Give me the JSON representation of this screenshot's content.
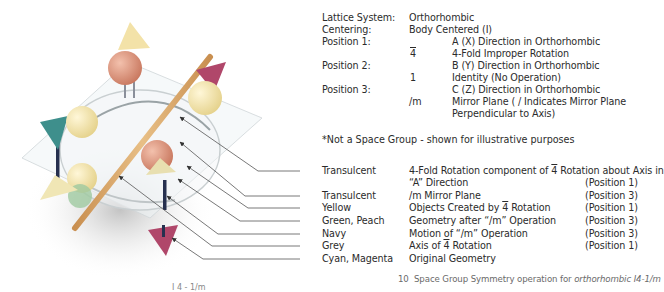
{
  "header": {
    "rows": [
      {
        "label": "Lattice System:",
        "symbol": "",
        "value": "Orthorhombic",
        "indent": false
      },
      {
        "label": "Centering:",
        "symbol": "",
        "value": "Body Centered (I)",
        "indent": false
      },
      {
        "label": "Position 1:",
        "symbol": "",
        "value": "A (X) Direction in Orthorhombic",
        "indent": true
      },
      {
        "label": "",
        "symbol": "4",
        "symbol_overline": true,
        "value": "4-Fold Improper Rotation",
        "indent": true
      },
      {
        "label": "Position 2:",
        "symbol": "",
        "value": "B (Y) Direction in Orthorhombic",
        "indent": true
      },
      {
        "label": "",
        "symbol": "1",
        "value": "Identity (No Operation)",
        "indent": true
      },
      {
        "label": "Position 3:",
        "symbol": "",
        "value": "C (Z) Direction in Orthorhombic",
        "indent": true
      },
      {
        "label": "",
        "symbol": "/m",
        "value": "Mirror Plane ( / Indicates Mirror Plane",
        "indent": true
      },
      {
        "label": "",
        "symbol": "",
        "value": "Perpendicular to Axis)",
        "indent": true
      }
    ],
    "footnote": "*Not a Space Group - shown for illustrative purposes"
  },
  "legend": {
    "rows": [
      {
        "color_name": "Transulcent",
        "description": "4-Fold Rotation component of 4 Rotation about Axis in",
        "description_pre": "4-Fold Rotation component of ",
        "description_bar": "4",
        "description_post": " Rotation about Axis in",
        "position": ""
      },
      {
        "color_name": "",
        "description": "“A” Direction",
        "position": "(Position 1)"
      },
      {
        "color_name": "Transulcent",
        "description": "/m Mirror Plane",
        "position": "(Position 3)"
      },
      {
        "color_name": "Yellow",
        "description_pre": "Objects Created by ",
        "description_bar": "4",
        "description_post": " Rotation",
        "position": "(Position 1)"
      },
      {
        "color_name": "Green, Peach",
        "description": "Geometry after “/m” Operation",
        "position": "(Position 3)"
      },
      {
        "color_name": "Navy",
        "description": "Motion of “/m” Operation",
        "position": "(Position 3)"
      },
      {
        "color_name": "Grey",
        "description_pre": "Axis of ",
        "description_bar": "4",
        "description_post": " Rotation",
        "position": "(Position 1)"
      },
      {
        "color_name": "Cyan, Magenta",
        "description": "Original Geometry",
        "position": ""
      }
    ]
  },
  "caption": {
    "number": "10",
    "text": "Space Group Symmetry operation for ",
    "italic": "orthorhombic I4-1/m"
  },
  "cut_text": "I 4 - 1/m",
  "colors": {
    "peach": "#e9a48a",
    "yellow": "#f3e6a2",
    "teal": "#3e8f8c",
    "magenta": "#b0476a",
    "rod": "#d8a86a",
    "navy": "#26304f",
    "green": "#9fc9a0",
    "leader": "#555555"
  }
}
